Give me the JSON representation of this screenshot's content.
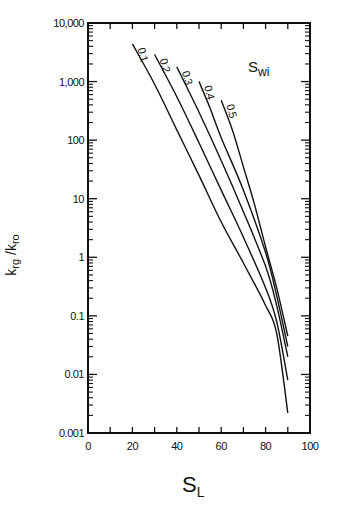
{
  "chart_data": {
    "type": "line",
    "title": "",
    "xlabel": "S_L",
    "ylabel": "k_rg / k_ro",
    "xscale": "linear",
    "yscale": "log",
    "xlim": [
      0,
      100
    ],
    "ylim": [
      0.001,
      10000
    ],
    "x_ticks": [
      "0",
      "20",
      "40",
      "60",
      "80",
      "100"
    ],
    "y_ticks": [
      "0.001",
      "0.01",
      "0.1",
      "1",
      "10",
      "100",
      "1,000",
      "10,000"
    ],
    "grid": false,
    "legend_title": "S_wi",
    "series": [
      {
        "name": "0.1",
        "x": [
          20,
          30,
          40,
          50,
          60,
          70,
          80,
          85,
          90
        ],
        "y": [
          4400,
          900,
          150,
          25,
          4,
          0.8,
          0.15,
          0.05,
          0.0022
        ]
      },
      {
        "name": "0.2",
        "x": [
          30,
          40,
          50,
          60,
          70,
          80,
          85,
          90
        ],
        "y": [
          2900,
          550,
          90,
          14,
          2.2,
          0.3,
          0.08,
          0.008
        ]
      },
      {
        "name": "0.3",
        "x": [
          40,
          50,
          60,
          70,
          80,
          85,
          90
        ],
        "y": [
          1780,
          300,
          45,
          6,
          0.7,
          0.15,
          0.02
        ]
      },
      {
        "name": "0.4",
        "x": [
          50,
          55,
          60,
          70,
          80,
          85,
          90
        ],
        "y": [
          1000,
          350,
          110,
          14,
          1.2,
          0.22,
          0.03
        ]
      },
      {
        "name": "0.5",
        "x": [
          60,
          65,
          70,
          75,
          80,
          85,
          90
        ],
        "y": [
          480,
          150,
          35,
          8,
          1.5,
          0.3,
          0.045
        ]
      }
    ]
  },
  "labels": {
    "ylabel_main1": "k",
    "ylabel_sub1": "rg",
    "ylabel_sep": " /k",
    "ylabel_sub2": "ro",
    "xlabel_main": "S",
    "xlabel_sub": "L",
    "legend_main": "S",
    "legend_sub": "wi"
  }
}
